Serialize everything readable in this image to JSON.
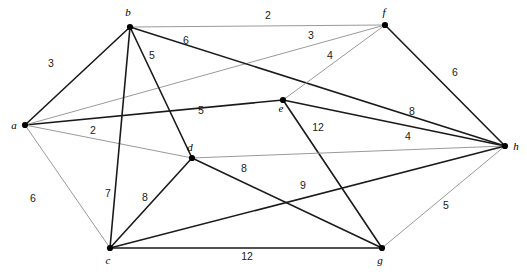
{
  "figure": {
    "kind": "weighted-undirected-graph",
    "width": 527,
    "height": 277,
    "background": "#ffffff"
  },
  "style": {
    "edge_dark_color": "#1a1a1a",
    "edge_light_color": "#9a9a9a",
    "edge_dark_width": 1.6,
    "edge_light_width": 1.0,
    "node_color": "#000000",
    "node_radius": 3.1,
    "label_color": "#1a1a1a"
  },
  "chart_data": {
    "type": "diagram",
    "title": "",
    "nodes": [
      {
        "id": "a",
        "label": "a",
        "x": 25,
        "y": 125,
        "label_x": 14,
        "label_y": 129
      },
      {
        "id": "b",
        "label": "b",
        "x": 130,
        "y": 27,
        "label_x": 128,
        "label_y": 16
      },
      {
        "id": "c",
        "label": "c",
        "x": 110,
        "y": 248,
        "label_x": 108,
        "label_y": 264
      },
      {
        "id": "d",
        "label": "d",
        "x": 192,
        "y": 158,
        "label_x": 190,
        "label_y": 151
      },
      {
        "id": "e",
        "label": "e",
        "x": 283,
        "y": 100,
        "label_x": 281,
        "label_y": 112
      },
      {
        "id": "f",
        "label": "f",
        "x": 385,
        "y": 25,
        "label_x": 384,
        "label_y": 16
      },
      {
        "id": "g",
        "label": "g",
        "x": 382,
        "y": 248,
        "label_x": 380,
        "label_y": 264
      },
      {
        "id": "h",
        "label": "h",
        "x": 505,
        "y": 146,
        "label_x": 516,
        "label_y": 150
      }
    ],
    "edges": [
      {
        "from": "a",
        "to": "b",
        "weight": 3,
        "tone": "dark",
        "label_x": 51,
        "label_y": 67
      },
      {
        "from": "a",
        "to": "e",
        "weight": 5,
        "tone": "dark",
        "label_x": 201,
        "label_y": 114
      },
      {
        "from": "a",
        "to": "d",
        "weight": 2,
        "tone": "light",
        "label_x": 93,
        "label_y": 134
      },
      {
        "from": "a",
        "to": "f",
        "weight": 3,
        "tone": "light",
        "label_x": 311,
        "label_y": 39
      },
      {
        "from": "a",
        "to": "c",
        "weight": 6,
        "tone": "light",
        "label_x": 33,
        "label_y": 202
      },
      {
        "from": "b",
        "to": "f",
        "weight": 2,
        "tone": "light",
        "label_x": 268,
        "label_y": 19
      },
      {
        "from": "b",
        "to": "h",
        "weight": 6,
        "tone": "dark",
        "label_x": 186,
        "label_y": 44
      },
      {
        "from": "b",
        "to": "c",
        "weight": 7,
        "tone": "dark",
        "label_x": 108,
        "label_y": 197
      },
      {
        "from": "b",
        "to": "d",
        "weight": 5,
        "tone": "dark",
        "label_x": 152,
        "label_y": 59
      },
      {
        "from": "e",
        "to": "f",
        "weight": 4,
        "tone": "light",
        "label_x": 330,
        "label_y": 59
      },
      {
        "from": "e",
        "to": "h",
        "weight": 8,
        "tone": "dark",
        "label_x": 412,
        "label_y": 115
      },
      {
        "from": "e",
        "to": "g",
        "weight": 12,
        "tone": "dark",
        "label_x": 318,
        "label_y": 131
      },
      {
        "from": "f",
        "to": "h",
        "weight": 6,
        "tone": "dark",
        "label_x": 455,
        "label_y": 76
      },
      {
        "from": "d",
        "to": "c",
        "weight": 8,
        "tone": "dark",
        "label_x": 145,
        "label_y": 201
      },
      {
        "from": "d",
        "to": "h",
        "weight": 4,
        "tone": "light",
        "label_x": 408,
        "label_y": 140
      },
      {
        "from": "d",
        "to": "g",
        "weight": 8,
        "tone": "dark",
        "label_x": 244,
        "label_y": 172
      },
      {
        "from": "c",
        "to": "h",
        "weight": 9,
        "tone": "dark",
        "label_x": 303,
        "label_y": 189
      },
      {
        "from": "c",
        "to": "g",
        "weight": 12,
        "tone": "dark",
        "label_x": 247,
        "label_y": 260
      },
      {
        "from": "g",
        "to": "h",
        "weight": 5,
        "tone": "light",
        "label_x": 446,
        "label_y": 209
      }
    ],
    "node_labels": [
      "a",
      "b",
      "c",
      "d",
      "e",
      "f",
      "g",
      "h"
    ],
    "edge_weights": [
      3,
      5,
      2,
      3,
      6,
      2,
      6,
      7,
      5,
      4,
      8,
      12,
      6,
      8,
      4,
      8,
      9,
      12,
      5
    ],
    "xlabel": "",
    "ylabel": "",
    "legend": []
  }
}
